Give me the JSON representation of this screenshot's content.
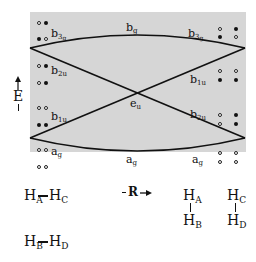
{
  "axis": {
    "energy_label": "E",
    "coordinate_label": "R"
  },
  "levels_left": [
    {
      "label": "b",
      "sub": "3",
      "subsub": "g"
    },
    {
      "label": "b",
      "sub": "2u"
    },
    {
      "label": "b",
      "sub": "1u"
    },
    {
      "label": "a",
      "sub": "g"
    }
  ],
  "levels_center": [
    {
      "label": "b",
      "sub": "g"
    },
    {
      "label": "e",
      "sub": "u"
    },
    {
      "label": "a",
      "sub": "g"
    }
  ],
  "levels_right": [
    {
      "label": "b",
      "sub": "3",
      "subsub": "g"
    },
    {
      "label": "b",
      "sub": "1u"
    },
    {
      "label": "b",
      "sub": "2u"
    },
    {
      "label": "a",
      "sub": "g"
    }
  ],
  "occupation_left": [
    [
      "open",
      "filled"
    ],
    [
      "filled",
      "open"
    ],
    [
      "open",
      "filled"
    ],
    [
      "open",
      "filled"
    ],
    [
      "open",
      "open"
    ],
    [
      "filled",
      "filled"
    ],
    [
      "open",
      "open"
    ],
    [
      "open",
      "open"
    ]
  ],
  "occupation_right": [
    [
      "open",
      "filled"
    ],
    [
      "filled",
      "open"
    ],
    [
      "open",
      "open"
    ],
    [
      "filled",
      "filled"
    ],
    [
      "open",
      "filled"
    ],
    [
      "open",
      "filled"
    ],
    [
      "open",
      "open"
    ],
    [
      "open",
      "open"
    ]
  ],
  "structures": {
    "left_top": {
      "a": "H",
      "a_sub": "A",
      "b": "H",
      "b_sub": "C"
    },
    "left_bottom": {
      "a": "H",
      "a_sub": "B",
      "b": "H",
      "b_sub": "D"
    },
    "right_1": {
      "top": "H",
      "top_sub": "A",
      "bottom": "H",
      "bottom_sub": "B"
    },
    "right_2": {
      "top": "H",
      "top_sub": "C",
      "bottom": "H",
      "bottom_sub": "D"
    }
  },
  "colors": {
    "panel": "#d6d6d6",
    "line": "#111111"
  }
}
